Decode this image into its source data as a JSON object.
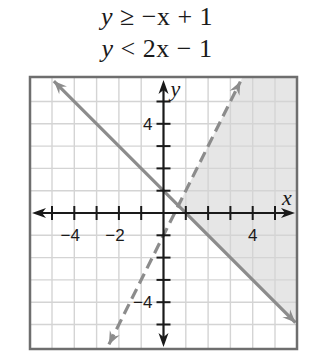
{
  "equations": [
    {
      "var": "y",
      "relation": "≥",
      "rhs": "−x + 1",
      "boundary": "solid"
    },
    {
      "var": "y",
      "relation": "<",
      "rhs": "2x − 1",
      "boundary": "dashed"
    }
  ],
  "graph": {
    "x_axis_label": "x",
    "y_axis_label": "y",
    "x_range": [
      -6,
      6
    ],
    "y_range": [
      -6,
      6
    ],
    "grid_step": 1,
    "x_tick_labels": [
      {
        "value": -4,
        "text": "−4"
      },
      {
        "value": -2,
        "text": "−2"
      },
      {
        "value": 4,
        "text": "4"
      }
    ],
    "y_tick_labels": [
      {
        "value": 4,
        "text": "4"
      },
      {
        "value": -4,
        "text": "−4"
      }
    ],
    "lines": [
      {
        "name": "y = -x + 1",
        "slope": -1,
        "intercept": 1,
        "style": "solid"
      },
      {
        "name": "y = 2x - 1",
        "slope": 2,
        "intercept": -1,
        "style": "dashed"
      }
    ],
    "shaded_region": "y ≥ -x + 1 and y < 2x - 1",
    "colors": {
      "shade": "#e6e6e6",
      "grid": "#d4d4d4",
      "line": "#8c8c8c",
      "axis": "#1a1a1a",
      "frame": "#6e6e6e"
    }
  }
}
